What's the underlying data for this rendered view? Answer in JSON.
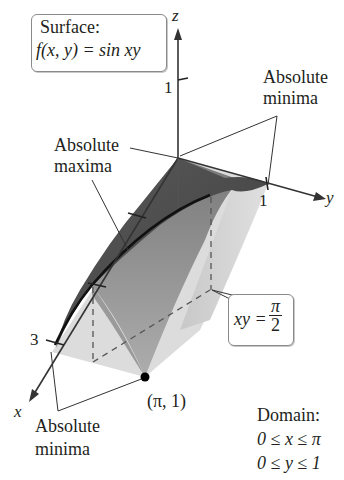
{
  "surface_box": {
    "line1": "Surface:",
    "func": "f(x, y) = sin xy"
  },
  "axes": {
    "z_label": "z",
    "y_label": "y",
    "x_label": "x",
    "z_tick": "1",
    "y_tick": "1",
    "x_tick": "3"
  },
  "annotations": {
    "abs_max_line1": "Absolute",
    "abs_max_line2": "maxima",
    "abs_min_top_line1": "Absolute",
    "abs_min_top_line2": "minima",
    "abs_min_bottom_line1": "Absolute",
    "abs_min_bottom_line2": "minima",
    "point_label": "(π, 1)"
  },
  "curve_box": {
    "lhs": "xy =",
    "num": "π",
    "den": "2"
  },
  "domain": {
    "title": "Domain:",
    "x_range": "0 ≤ x ≤ π",
    "y_range": "0 ≤ y ≤ 1"
  },
  "colors": {
    "surface_dark": "#4a4a4a",
    "surface_mid": "#8c8c8c",
    "surface_light": "#d6d6d6",
    "axis": "#333333"
  }
}
